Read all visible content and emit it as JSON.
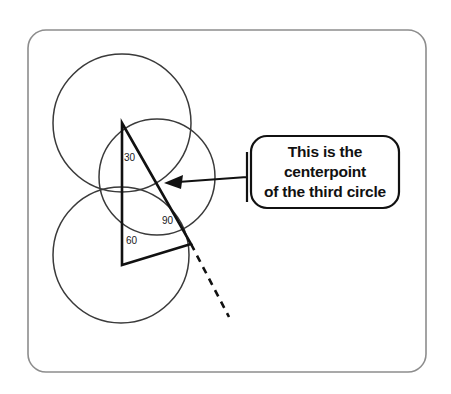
{
  "canvas": {
    "width": 451,
    "height": 394,
    "background": "#ffffff"
  },
  "frame": {
    "name": "slide-border",
    "x": 28,
    "y": 30,
    "width": 398,
    "height": 342,
    "radius": 18,
    "stroke": "#8d8d8d"
  },
  "diagram": {
    "stroke_circle": "#3a3a3a",
    "stroke_triangle": "#111111",
    "circles": [
      {
        "name": "circle-top-left",
        "cx": 122,
        "cy": 123,
        "r": 69
      },
      {
        "name": "circle-bottom-left",
        "cx": 121,
        "cy": 255,
        "r": 68
      },
      {
        "name": "circle-middle",
        "cx": 157,
        "cy": 177,
        "r": 58
      }
    ],
    "triangle": {
      "name": "angle-triangle",
      "vertices": [
        {
          "name": "apex-top",
          "x": 122,
          "y": 123
        },
        {
          "name": "vertex-right",
          "x": 191,
          "y": 244
        },
        {
          "name": "vertex-bottom",
          "x": 122,
          "y": 265
        }
      ]
    },
    "dashed_line": {
      "name": "extension-dashed-line",
      "x1": 191,
      "y1": 244,
      "x2": 229,
      "y2": 317
    },
    "angles": [
      {
        "name": "angle-label-30",
        "value": "30",
        "x": 124,
        "y": 153
      },
      {
        "name": "angle-label-90",
        "value": "90",
        "x": 162,
        "y": 216
      },
      {
        "name": "angle-label-60",
        "value": "60",
        "x": 126,
        "y": 236
      }
    ],
    "arrow": {
      "name": "callout-arrow",
      "tip_x": 166,
      "tip_y": 183,
      "elbow_x": 247,
      "elbow_y": 176,
      "tail_x": 247,
      "tail_y": 152,
      "tail_end_y": 202
    }
  },
  "callout": {
    "name": "callout-bubble",
    "x": 251,
    "y": 136,
    "width": 148,
    "height": 72,
    "radius": 16,
    "lines": [
      "This is the",
      "centerpoint",
      "of the third circle"
    ],
    "text_color": "#111111",
    "border_color": "#111111"
  }
}
